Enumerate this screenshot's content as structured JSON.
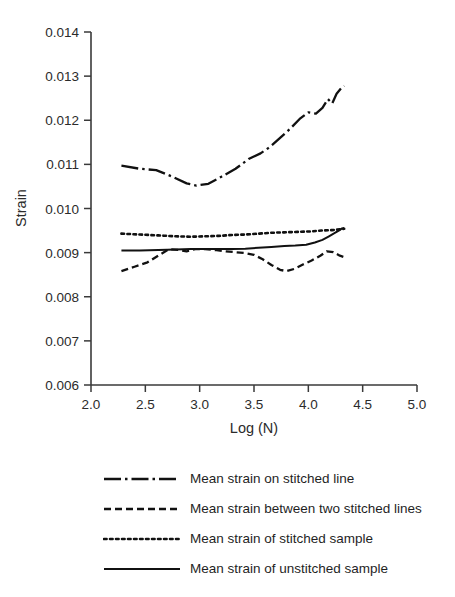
{
  "chart_data": {
    "type": "line",
    "title": "",
    "xlabel": "Log (N)",
    "ylabel": "Strain",
    "xlim": [
      2.0,
      5.0
    ],
    "ylim": [
      0.006,
      0.014
    ],
    "xticks": [
      "2.0",
      "2.5",
      "3.0",
      "3.5",
      "4.0",
      "4.5",
      "5.0"
    ],
    "xtick_values": [
      2.0,
      2.5,
      3.0,
      3.5,
      4.0,
      4.5,
      5.0
    ],
    "yticks": [
      "0.006",
      "0.007",
      "0.008",
      "0.009",
      "0.010",
      "0.011",
      "0.012",
      "0.013",
      "0.014"
    ],
    "ytick_values": [
      0.006,
      0.007,
      0.008,
      0.009,
      0.01,
      0.011,
      0.012,
      0.013,
      0.014
    ],
    "grid": false,
    "legend_position": "below",
    "line_color": "#111111",
    "series": [
      {
        "name": "Mean strain on stitched line",
        "style": "dash-dot",
        "x": [
          2.28,
          2.45,
          2.6,
          2.75,
          2.88,
          2.97,
          3.08,
          3.2,
          3.33,
          3.45,
          3.56,
          3.65,
          3.74,
          3.83,
          3.92,
          4.0,
          4.07,
          4.13,
          4.18,
          4.22,
          4.26,
          4.3,
          4.33
        ],
        "y": [
          0.01097,
          0.0109,
          0.01087,
          0.01072,
          0.01057,
          0.01052,
          0.01056,
          0.01072,
          0.0109,
          0.01112,
          0.01125,
          0.0114,
          0.0116,
          0.0118,
          0.01203,
          0.01218,
          0.01215,
          0.01228,
          0.01248,
          0.01238,
          0.0126,
          0.01272,
          0.01278
        ]
      },
      {
        "name": "Mean strain between two stitched lines",
        "style": "dashed",
        "x": [
          2.28,
          2.4,
          2.52,
          2.63,
          2.72,
          2.8,
          2.88,
          2.96,
          3.05,
          3.14,
          3.24,
          3.33,
          3.42,
          3.5,
          3.58,
          3.66,
          3.74,
          3.8,
          3.87,
          3.95,
          4.03,
          4.11,
          4.17,
          4.23,
          4.29,
          4.33
        ],
        "y": [
          0.00858,
          0.00868,
          0.00878,
          0.00895,
          0.00908,
          0.00906,
          0.00903,
          0.00908,
          0.00908,
          0.00906,
          0.00903,
          0.00901,
          0.00899,
          0.00895,
          0.00885,
          0.00872,
          0.00861,
          0.00858,
          0.00863,
          0.00873,
          0.00882,
          0.00893,
          0.00903,
          0.00901,
          0.00893,
          0.0089
        ]
      },
      {
        "name": "Mean strain of stitched sample",
        "style": "dotted",
        "x": [
          2.28,
          2.45,
          2.62,
          2.78,
          2.92,
          3.05,
          3.18,
          3.3,
          3.42,
          3.54,
          3.66,
          3.78,
          3.9,
          4.02,
          4.12,
          4.22,
          4.3,
          4.33
        ],
        "y": [
          0.00943,
          0.00941,
          0.00939,
          0.00937,
          0.00936,
          0.00937,
          0.00938,
          0.0094,
          0.00941,
          0.00943,
          0.00945,
          0.00946,
          0.00947,
          0.00948,
          0.0095,
          0.00951,
          0.00953,
          0.00954
        ]
      },
      {
        "name": "Mean strain of unstitched sample",
        "style": "solid",
        "x": [
          2.28,
          2.45,
          2.62,
          2.78,
          2.92,
          3.05,
          3.18,
          3.3,
          3.42,
          3.54,
          3.66,
          3.78,
          3.88,
          3.98,
          4.06,
          4.13,
          4.19,
          4.24,
          4.28,
          4.31,
          4.33
        ],
        "y": [
          0.00905,
          0.00905,
          0.00906,
          0.00907,
          0.00908,
          0.00908,
          0.00908,
          0.00908,
          0.00909,
          0.00911,
          0.00913,
          0.00915,
          0.00916,
          0.00918,
          0.00923,
          0.00929,
          0.00937,
          0.00944,
          0.0095,
          0.00955,
          0.00956
        ]
      }
    ]
  },
  "legend": {
    "items": [
      {
        "label": "Mean strain on stitched line",
        "style": "dash-dot"
      },
      {
        "label": "Mean strain between two stitched lines",
        "style": "dashed"
      },
      {
        "label": "Mean strain of stitched sample",
        "style": "dotted"
      },
      {
        "label": "Mean strain of unstitched sample",
        "style": "solid"
      }
    ]
  }
}
